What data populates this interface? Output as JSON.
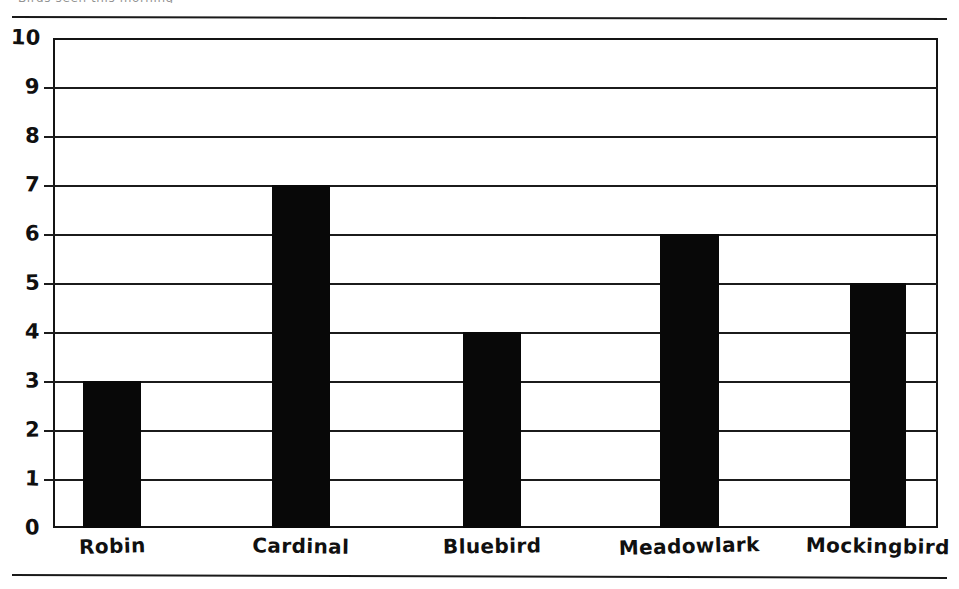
{
  "page": {
    "clipped_caption_fragment": "Birds seen this morning",
    "rule_top_label": "horizontal-rule",
    "rule_bottom_label": "horizontal-rule"
  },
  "chart_data": {
    "type": "bar",
    "title": "",
    "xlabel": "",
    "ylabel": "",
    "ylim": [
      0,
      10
    ],
    "ytick_step": 1,
    "grid": true,
    "legend": false,
    "orientation": "vertical",
    "bar_color": "#080808",
    "categories": [
      "Robin",
      "Cardinal",
      "Bluebird",
      "Meadowlark",
      "Mockingbird"
    ],
    "values": [
      3,
      7,
      4,
      6,
      5
    ],
    "yticks": [
      "0",
      "1",
      "2",
      "3",
      "4",
      "5",
      "6",
      "7",
      "8",
      "9",
      "10"
    ],
    "bars": [
      {
        "label": "Robin",
        "value": 3,
        "left_pct": 3.4,
        "width_pct": 6.6
      },
      {
        "label": "Cardinal",
        "value": 7,
        "left_pct": 24.7,
        "width_pct": 6.6
      },
      {
        "label": "Bluebird",
        "value": 4,
        "left_pct": 46.3,
        "width_pct": 6.6
      },
      {
        "label": "Meadowlark",
        "value": 6,
        "left_pct": 68.6,
        "width_pct": 6.6
      },
      {
        "label": "Mockingbird",
        "value": 5,
        "left_pct": 90.0,
        "width_pct": 6.4
      }
    ]
  }
}
